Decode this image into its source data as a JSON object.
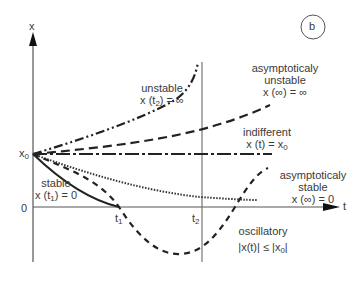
{
  "figure": {
    "panel_label": "b",
    "axes": {
      "y_label": "x",
      "x_label": "t",
      "y_ticks": [
        "x0",
        "0"
      ],
      "x_ticks": [
        "t1",
        "t2"
      ]
    },
    "curves": [
      {
        "id": "unstable",
        "style": "dash-dot-dot",
        "title": "unstable",
        "condition": "x (t2) = ∞"
      },
      {
        "id": "asymptotically-unstable",
        "style": "dashed",
        "title_line1": "asymptoticaly",
        "title_line2": "unstable",
        "condition": "x (∞) = ∞"
      },
      {
        "id": "indifferent",
        "style": "dash-dot",
        "title": "indifferent",
        "condition": "x (t) = x0"
      },
      {
        "id": "asymptotically-stable",
        "style": "dotted",
        "title_line1": "asymptoticaly",
        "title_line2": "stable",
        "condition": "x (∞) = 0"
      },
      {
        "id": "stable",
        "style": "solid",
        "title": "stable",
        "condition": "x (t1) = 0"
      },
      {
        "id": "oscillatory",
        "style": "short-dashed",
        "title": "oscillatory",
        "condition": "|x(t)| ≤ |x0|"
      }
    ]
  },
  "labels": {
    "panel": "b",
    "y_axis": "x",
    "x_axis": "t",
    "x0_main": "x",
    "x0_sub": "0",
    "zero": "0",
    "t1_main": "t",
    "t1_sub": "1",
    "t2_main": "t",
    "t2_sub": "2",
    "unstable_title": "unstable",
    "unstable_cond_a": "x (t",
    "unstable_cond_sub": "2",
    "unstable_cond_b": ") = ∞",
    "asym_unstable_1": "asymptoticaly",
    "asym_unstable_2": "unstable",
    "asym_unstable_cond": "x (∞) = ∞",
    "indifferent_title": "indifferent",
    "indifferent_cond_a": "x (t) = x",
    "indifferent_cond_sub": "0",
    "asym_stable_1": "asymptoticaly",
    "asym_stable_2": "stable",
    "asym_stable_cond": "x (∞) = 0",
    "stable_title": "stable",
    "stable_cond_a": "x (t",
    "stable_cond_sub": "1",
    "stable_cond_b": ") = 0",
    "osc_title": "oscillatory",
    "osc_cond_a": "|x(t)| ≤ |x",
    "osc_cond_sub": "0",
    "osc_cond_b": "|"
  }
}
